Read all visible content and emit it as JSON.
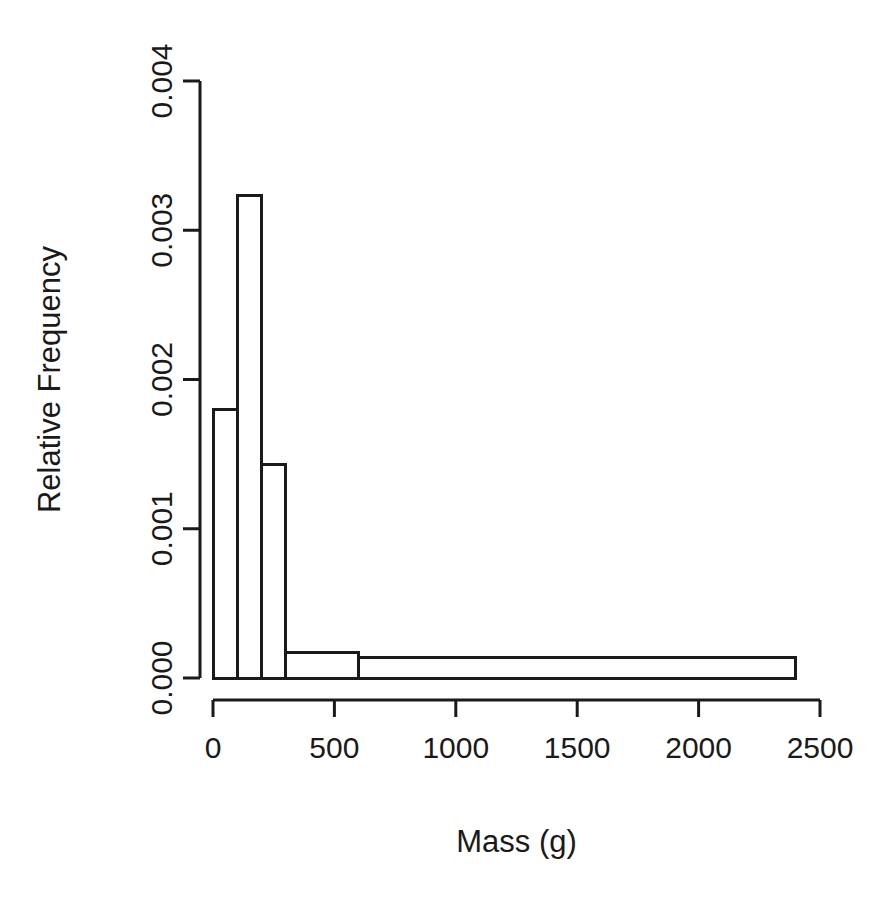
{
  "chart_data": {
    "type": "bar",
    "title": "",
    "subtitle": "",
    "xlabel": "Mass (g)",
    "ylabel": "Relative Frequency",
    "xlim": [
      0,
      2500
    ],
    "ylim": [
      0.0,
      0.004
    ],
    "grid": false,
    "legend": null,
    "note": "R-style histogram with unequal bin widths; bar outlines only, no fill",
    "xticks": [
      0,
      500,
      1000,
      1500,
      2000,
      2500
    ],
    "xtick_labels": [
      "0",
      "500",
      "1000",
      "1500",
      "2000",
      "2500"
    ],
    "yticks": [
      0.0,
      0.001,
      0.002,
      0.003,
      0.004
    ],
    "ytick_labels": [
      "0.000",
      "0.001",
      "0.002",
      "0.003",
      "0.004"
    ],
    "bins": [
      {
        "x0": 0,
        "x1": 100,
        "density": 0.0018
      },
      {
        "x0": 100,
        "x1": 200,
        "density": 0.00323
      },
      {
        "x0": 200,
        "x1": 300,
        "density": 0.00143
      },
      {
        "x0": 300,
        "x1": 600,
        "density": 0.00017
      },
      {
        "x0": 600,
        "x1": 2400,
        "density": 0.00014
      }
    ],
    "categories": [
      "0-100",
      "100-200",
      "200-300",
      "300-600",
      "600-2400"
    ],
    "values": [
      0.0018,
      0.00323,
      0.00143,
      0.00017,
      0.00014
    ],
    "colors": {
      "bar_stroke": "#1a1a1a",
      "bar_fill": "none",
      "axis": "#1a1a1a",
      "background": "#ffffff"
    }
  }
}
